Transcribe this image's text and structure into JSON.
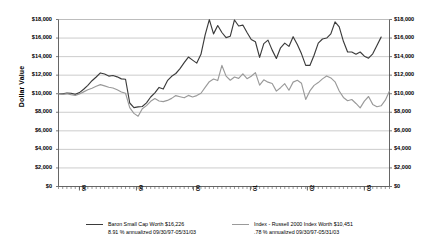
{
  "chart_data": {
    "type": "line",
    "title": "",
    "xlabel": "",
    "ylabel": "Dollar Value",
    "ylim": [
      0,
      18000
    ],
    "yticks": [
      0,
      2000,
      4000,
      6000,
      8000,
      10000,
      12000,
      14000,
      16000,
      18000
    ],
    "ytick_labels": [
      "$0",
      "$2,000",
      "$4,000",
      "$6,000",
      "$8,000",
      "$10,000",
      "$12,000",
      "$14,000",
      "$16,000",
      "$18,000"
    ],
    "xtick_labels": [
      "98",
      "99",
      "00",
      "01",
      "02",
      "03"
    ],
    "xlim": [
      0,
      68
    ],
    "grid": true,
    "legend_position": "bottom",
    "dual_y_axis": true,
    "series": [
      {
        "name": "Baron Small Cap Worth $16,226",
        "color": "#3b3b3b",
        "values": [
          10000,
          9980,
          10080,
          10050,
          9930,
          10120,
          10480,
          10900,
          11400,
          11800,
          12240,
          12120,
          11900,
          11960,
          11820,
          11600,
          11560,
          9000,
          8500,
          8580,
          8620,
          9020,
          9650,
          10100,
          10680,
          10500,
          11400,
          11880,
          12180,
          12700,
          13350,
          13950,
          13620,
          13300,
          14250,
          16350,
          17980,
          16450,
          17350,
          16600,
          16050,
          16200,
          17950,
          17300,
          17400,
          16600,
          15850,
          15600,
          13920,
          15400,
          15780,
          14700,
          13800,
          14950,
          15450,
          15100,
          16150,
          15300,
          14300,
          13050,
          13050,
          14150,
          15450,
          15900,
          16000,
          16450,
          17750,
          17200,
          15650,
          14500,
          14500,
          14250,
          14500,
          14050,
          13830,
          14300,
          15200,
          16100
        ]
      },
      {
        "name": "Index - Russell 2000 Index Worth $10,451",
        "color": "#9a9a9a",
        "values": [
          10000,
          9930,
          9990,
          9900,
          9820,
          9980,
          10200,
          10420,
          10600,
          10800,
          10980,
          10850,
          10700,
          10620,
          10420,
          10180,
          10050,
          8500,
          7880,
          7580,
          8380,
          8720,
          9180,
          9480,
          9220,
          9150,
          9280,
          9500,
          9800,
          9680,
          9560,
          9820,
          9650,
          9800,
          10050,
          10680,
          11300,
          11580,
          11420,
          13050,
          11900,
          11450,
          11800,
          11650,
          12150,
          11620,
          11880,
          12280,
          10920,
          11500,
          11250,
          11100,
          10280,
          10650,
          11080,
          10380,
          11250,
          11450,
          11120,
          9380,
          10300,
          10900,
          11200,
          11600,
          11920,
          11700,
          11280,
          10300,
          9600,
          9250,
          9380,
          8950,
          8480,
          9200,
          9700,
          8850,
          8600,
          8700,
          9300,
          10300
        ]
      }
    ]
  },
  "legend": {
    "items": [
      {
        "line1": "Baron Small Cap Worth $16,226",
        "line2": "8.91 % annualized 09/30/97-05/31/03",
        "color": "#3b3b3b"
      },
      {
        "line1": "Index - Russell 2000 Index Worth $10,451",
        "line2": ".78 % annualized 09/30/97-05/31/03",
        "color": "#9a9a9a"
      }
    ]
  },
  "colors": {
    "axis": "#555555",
    "grid": "#b6b6b6",
    "background": "#ffffff"
  }
}
